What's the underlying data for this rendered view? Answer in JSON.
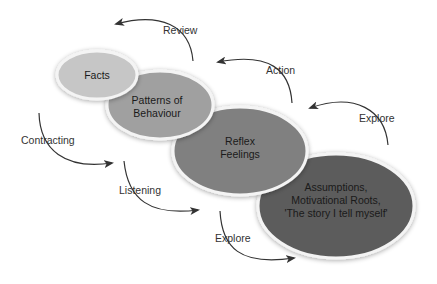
{
  "diagram": {
    "type": "layered-ellipses-with-arrows",
    "ellipses": [
      {
        "id": "facts",
        "lines": [
          "Facts"
        ],
        "cx": 97,
        "cy": 75,
        "rx": 40,
        "ry": 24,
        "fill": "#c6c6c6"
      },
      {
        "id": "patterns",
        "lines": [
          "Patterns of",
          "Behaviour"
        ],
        "cx": 160,
        "cy": 105,
        "rx": 53,
        "ry": 34,
        "fill": "#a0a0a0"
      },
      {
        "id": "reflex",
        "lines": [
          "Reflex",
          "Feelings"
        ],
        "cx": 240,
        "cy": 151,
        "rx": 67,
        "ry": 44,
        "fill": "#808080"
      },
      {
        "id": "assumptions",
        "lines": [
          "Assumptions,",
          "Motivational Roots,",
          "'The story I tell myself'"
        ],
        "cx": 336,
        "cy": 206,
        "rx": 78,
        "ry": 52,
        "fill": "#5c5c5c"
      }
    ],
    "arrow_labels": {
      "review": "Review",
      "action": "Action",
      "explore_top": "Explore",
      "contracting": "Contracting",
      "listening": "Listening",
      "explore_bottom": "Explore"
    },
    "colors": {
      "arrow": "#333333",
      "outline": "#f2f2f2"
    }
  }
}
